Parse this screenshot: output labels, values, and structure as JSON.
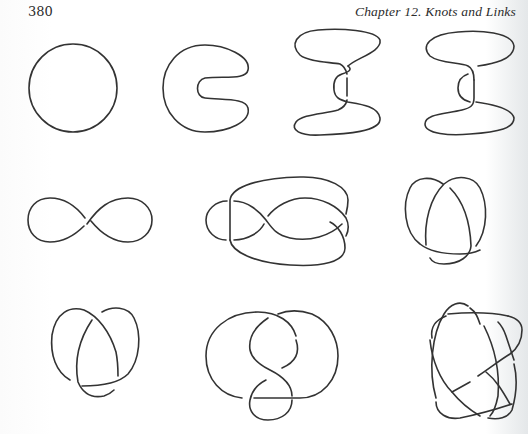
{
  "header": {
    "page_number": "380",
    "running_head": "Chapter 12.  Knots and Links"
  },
  "figures": {
    "rows": [
      {
        "row": 1,
        "items": [
          {
            "id": "unknot-circle",
            "description": "round circle (unknot)"
          },
          {
            "id": "unknot-c-shape",
            "description": "C-shaped deformed loop"
          },
          {
            "id": "unknot-s-fold-1",
            "description": "S-fold loop with two crossings"
          },
          {
            "id": "unknot-s-fold-2",
            "description": "S-fold loop with two crossings, alternate"
          }
        ]
      },
      {
        "row": 2,
        "items": [
          {
            "id": "unknot-figure-eight",
            "description": "figure-eight curve with one crossing"
          },
          {
            "id": "knot-diagram-b",
            "description": "looped diagram with several crossings"
          },
          {
            "id": "trefoil-1",
            "description": "trefoil knot diagram"
          }
        ]
      },
      {
        "row": 3,
        "items": [
          {
            "id": "trefoil-2",
            "description": "trefoil knot diagram"
          },
          {
            "id": "knot-diagram-c",
            "description": "looped diagram with lower loop"
          },
          {
            "id": "star-knot",
            "description": "five-crossing star knot"
          }
        ]
      }
    ]
  },
  "colors": {
    "ink": "#333333",
    "paper": "#ffffff"
  }
}
